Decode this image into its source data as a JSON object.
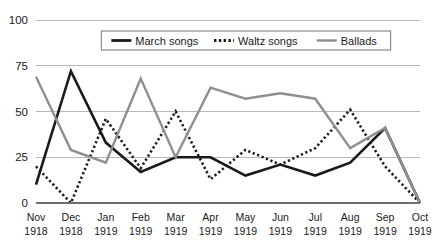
{
  "chart_data": {
    "type": "line",
    "title": "",
    "subtitle": "",
    "xlabel": "",
    "ylabel": "",
    "ylim": [
      0,
      100
    ],
    "yticks": [
      0,
      25,
      50,
      75,
      100
    ],
    "ytick_labels": [
      "0",
      "25",
      "50",
      "75",
      "100"
    ],
    "grid": true,
    "legend_position": "top-center",
    "categories": [
      "Nov\n1918",
      "Dec\n1918",
      "Jan\n1919",
      "Feb\n1919",
      "Mar\n1919",
      "Apr\n1919",
      "May\n1919",
      "Jun\n1919",
      "Jul\n1919",
      "Aug\n1919",
      "Sep\n1919",
      "Oct\n1919"
    ],
    "categories_month": [
      "Nov",
      "Dec",
      "Jan",
      "Feb",
      "Mar",
      "Apr",
      "May",
      "Jun",
      "Jul",
      "Aug",
      "Sep",
      "Oct"
    ],
    "categories_year": [
      "1918",
      "1918",
      "1919",
      "1919",
      "1919",
      "1919",
      "1919",
      "1919",
      "1919",
      "1919",
      "1919",
      "1919"
    ],
    "series": [
      {
        "name": "March songs",
        "style": "solid",
        "color": "#1a1a1a",
        "width": 2.6,
        "values": [
          10,
          72,
          33,
          17,
          25,
          25,
          15,
          21,
          15,
          22,
          41,
          0
        ]
      },
      {
        "name": "Waltz songs",
        "style": "dotted",
        "color": "#1a1a1a",
        "width": 2.6,
        "values": [
          20,
          0,
          46,
          19,
          50,
          13,
          29,
          21,
          30,
          51,
          20,
          0
        ]
      },
      {
        "name": "Ballads",
        "style": "solid",
        "color": "#8f8f8f",
        "width": 2.4,
        "values": [
          69,
          29,
          22,
          68,
          25,
          63,
          57,
          60,
          57,
          30,
          41,
          0
        ]
      }
    ]
  },
  "legend": {
    "items": [
      {
        "label": "March songs"
      },
      {
        "label": "Waltz songs"
      },
      {
        "label": "Ballads"
      }
    ]
  },
  "colors": {
    "march": "#1a1a1a",
    "waltz": "#1a1a1a",
    "ballads": "#8f8f8f",
    "gridline": "#b9b9b9",
    "axis": "#6e6e6e",
    "text": "#1a1a1a",
    "background": "#ffffff"
  }
}
